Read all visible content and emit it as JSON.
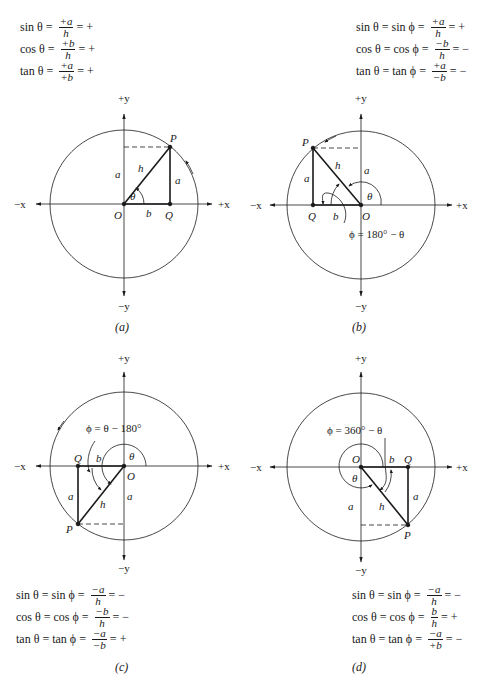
{
  "panels": [
    {
      "id": "a",
      "caption": "(a)",
      "equations": [
        {
          "lhs": "sin θ =",
          "num": "+a",
          "den": "h",
          "sign": "= +"
        },
        {
          "lhs": "cos θ =",
          "num": "+b",
          "den": "h",
          "sign": "= +"
        },
        {
          "lhs": "tan θ =",
          "num": "+a",
          "den": "+b",
          "sign": "= +"
        }
      ],
      "labels": {
        "py": "+y",
        "ny": "−y",
        "px": "+x",
        "nx": "−x",
        "O": "O",
        "P": "P",
        "Q": "Q",
        "a_side": "a",
        "a_axis": "a",
        "b": "b",
        "h": "h",
        "theta": "θ"
      }
    },
    {
      "id": "b",
      "caption": "(b)",
      "equations": [
        {
          "lhs": "sin θ = sin ϕ =",
          "num": "+a",
          "den": "h",
          "sign": "= +"
        },
        {
          "lhs": "cos θ = cos ϕ =",
          "num": "−b",
          "den": "h",
          "sign": "= −"
        },
        {
          "lhs": "tan θ = tan ϕ =",
          "num": "+a",
          "den": "−b",
          "sign": "= −"
        }
      ],
      "labels": {
        "py": "+y",
        "ny": "−y",
        "px": "+x",
        "nx": "−x",
        "O": "O",
        "P": "P",
        "Q": "Q",
        "a_side": "a",
        "a_axis": "a",
        "b": "b",
        "h": "h",
        "theta": "θ",
        "phi_def": "ϕ = 180° − θ"
      }
    },
    {
      "id": "c",
      "caption": "(c)",
      "equations": [
        {
          "lhs": "sin θ = sin ϕ =",
          "num": "−a",
          "den": "h",
          "sign": "= −"
        },
        {
          "lhs": "cos θ = cos ϕ =",
          "num": "−b",
          "den": "h",
          "sign": "= −"
        },
        {
          "lhs": "tan θ = tan ϕ =",
          "num": "−a",
          "den": "−b",
          "sign": "= +"
        }
      ],
      "labels": {
        "py": "+y",
        "ny": "−y",
        "px": "+x",
        "nx": "−x",
        "O": "O",
        "P": "P",
        "Q": "Q",
        "a_side": "a",
        "a_axis": "a",
        "b": "b",
        "h": "h",
        "theta": "θ",
        "phi_def": "ϕ = θ − 180°"
      }
    },
    {
      "id": "d",
      "caption": "(d)",
      "equations": [
        {
          "lhs": "sin θ = sin ϕ =",
          "num": "−a",
          "den": "h",
          "sign": "= −"
        },
        {
          "lhs": "cos θ = cos ϕ =",
          "num": "b",
          "den": "h",
          "sign": "= +"
        },
        {
          "lhs": "tan θ = tan ϕ =",
          "num": "−a",
          "den": "+b",
          "sign": "= −"
        }
      ],
      "labels": {
        "py": "+y",
        "ny": "−y",
        "px": "+x",
        "nx": "−x",
        "O": "O",
        "P": "P",
        "Q": "Q",
        "a_side": "a",
        "a_axis": "a",
        "b": "b",
        "h": "h",
        "theta": "θ",
        "phi_def": "ϕ = 360° − θ"
      }
    }
  ]
}
